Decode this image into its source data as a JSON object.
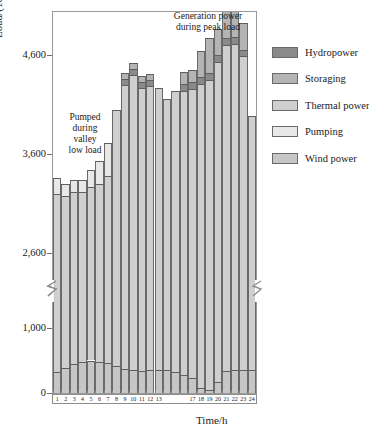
{
  "axes": {
    "y_title": "Load/(10MW)",
    "x_title": "Time/h",
    "y_ticks": [
      "0",
      "1,000",
      "2,600",
      "3,600",
      "4,600"
    ],
    "x_ticks": [
      "1",
      "2",
      "3",
      "4",
      "5",
      "6",
      "7",
      "8",
      "9",
      "10",
      "11",
      "12",
      "13",
      "",
      "",
      "",
      "17",
      "18",
      "19",
      "20",
      "21",
      "22",
      "23",
      "24"
    ]
  },
  "annotations": {
    "peak": "Generation power\nduring peak load",
    "valley": "Pumped\nduring\nvalley\nlow load"
  },
  "legend": {
    "items": [
      {
        "label": "Hydropower",
        "color": "#8a8a8a"
      },
      {
        "label": "Storaging",
        "color": "#b4b4b4"
      },
      {
        "label": "Thermal power",
        "color": "#cfcfcf"
      },
      {
        "label": "Pumping",
        "color": "#e8e8e8"
      },
      {
        "label": "Wind power",
        "color": "#c6c6c6"
      }
    ]
  },
  "chart_data": {
    "type": "bar",
    "stacked": true,
    "title": "",
    "xlabel": "Time/h",
    "ylabel": "Load/(10MW)",
    "grid": false,
    "legend_position": "right",
    "broken_axis": {
      "lower_range": [
        0,
        1400
      ],
      "upper_range": [
        2200,
        5000
      ],
      "break_note": "y-axis is discontinuous between the lower band (0-1,400) and the upper band (2,200-5,000)"
    },
    "categories": [
      "1",
      "2",
      "3",
      "4",
      "5",
      "6",
      "7",
      "8",
      "9",
      "10",
      "11",
      "12",
      "13",
      "14",
      "15",
      "16",
      "17",
      "18",
      "19",
      "20",
      "21",
      "22",
      "23",
      "24"
    ],
    "series": [
      {
        "name": "Wind power",
        "color": "#c6c6c6",
        "values": [
          330,
          380,
          450,
          480,
          500,
          470,
          460,
          410,
          370,
          350,
          340,
          360,
          360,
          360,
          330,
          280,
          230,
          80,
          50,
          170,
          340,
          350,
          350,
          350
        ]
      },
      {
        "name": "Thermal power",
        "color": "#cfcfcf",
        "values": [
          2860,
          2790,
          2760,
          2730,
          2770,
          2830,
          2920,
          3640,
          3930,
          4050,
          3930,
          3930,
          3910,
          3800,
          3910,
          3960,
          4030,
          4230,
          4300,
          4360,
          4370,
          4370,
          4240,
          3640
        ]
      },
      {
        "name": "Hydropower",
        "color": "#8a8a8a",
        "values": [
          0,
          0,
          0,
          0,
          0,
          0,
          0,
          0,
          60,
          60,
          60,
          60,
          0,
          0,
          0,
          70,
          70,
          70,
          70,
          70,
          70,
          70,
          70,
          0
        ]
      },
      {
        "name": "Storaging",
        "color": "#b4b4b4",
        "values": [
          0,
          0,
          0,
          0,
          0,
          0,
          0,
          0,
          60,
          60,
          60,
          60,
          0,
          0,
          0,
          120,
          120,
          270,
          360,
          270,
          270,
          270,
          270,
          0
        ]
      },
      {
        "name": "Pumping",
        "color": "#e8e8e8",
        "values": [
          170,
          130,
          130,
          130,
          170,
          230,
          330,
          0,
          0,
          0,
          0,
          0,
          0,
          0,
          0,
          0,
          0,
          0,
          0,
          0,
          0,
          0,
          0,
          0
        ]
      }
    ]
  }
}
